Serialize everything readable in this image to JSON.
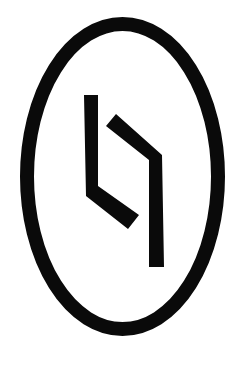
{
  "logo": {
    "description": "oval-enclosed angular glyph emblem",
    "colors": {
      "background": "#ffffff",
      "ink": "#0a0a0a"
    },
    "ellipse": {
      "cx": 122.5,
      "cy": 176.5,
      "rx": 95.5,
      "ry": 152.5,
      "stroke_width": 14
    },
    "left_stroke": {
      "points": "84,95 98,95 98,186 139,215 128,229 86,196"
    },
    "right_stroke": {
      "points": "116,114 106,126 149,160 149,267 164,267 162,155"
    }
  }
}
